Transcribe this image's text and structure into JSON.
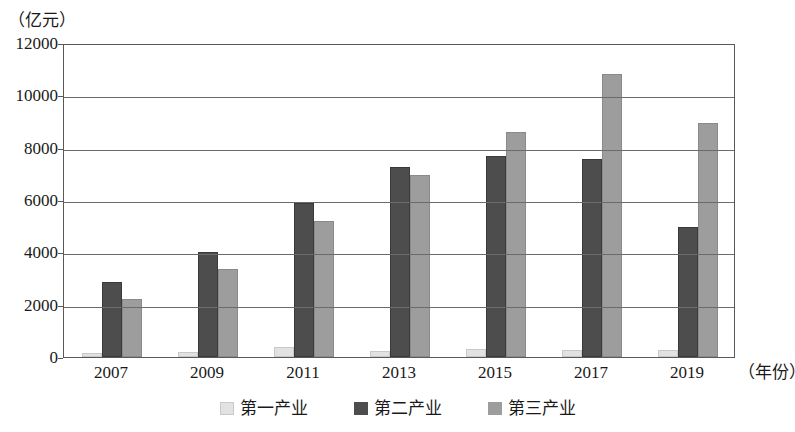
{
  "chart_data": {
    "type": "bar",
    "title": "",
    "subtitle": "",
    "xlabel": "（年份）",
    "ylabel": "（亿元）",
    "categories": [
      "2007",
      "2009",
      "2011",
      "2013",
      "2015",
      "2017",
      "2019"
    ],
    "series": [
      {
        "name": "第一产业",
        "color": "#e2e2e2",
        "values": [
          150,
          180,
          380,
          230,
          300,
          260,
          260
        ]
      },
      {
        "name": "第二产业",
        "color": "#4d4d4d",
        "values": [
          2850,
          4000,
          5900,
          7250,
          7700,
          7580,
          4980
        ]
      },
      {
        "name": "第三产业",
        "color": "#9d9d9d",
        "values": [
          2220,
          3380,
          5200,
          6950,
          8600,
          10800,
          8950
        ]
      }
    ],
    "ylim": [
      0,
      12000
    ],
    "yticks": [
      0,
      2000,
      4000,
      6000,
      8000,
      10000,
      12000
    ],
    "ytick_labels": [
      "0",
      "2000",
      "4000",
      "6000",
      "8000",
      "10000",
      "12000"
    ],
    "grid": true,
    "legend_position": "bottom"
  }
}
